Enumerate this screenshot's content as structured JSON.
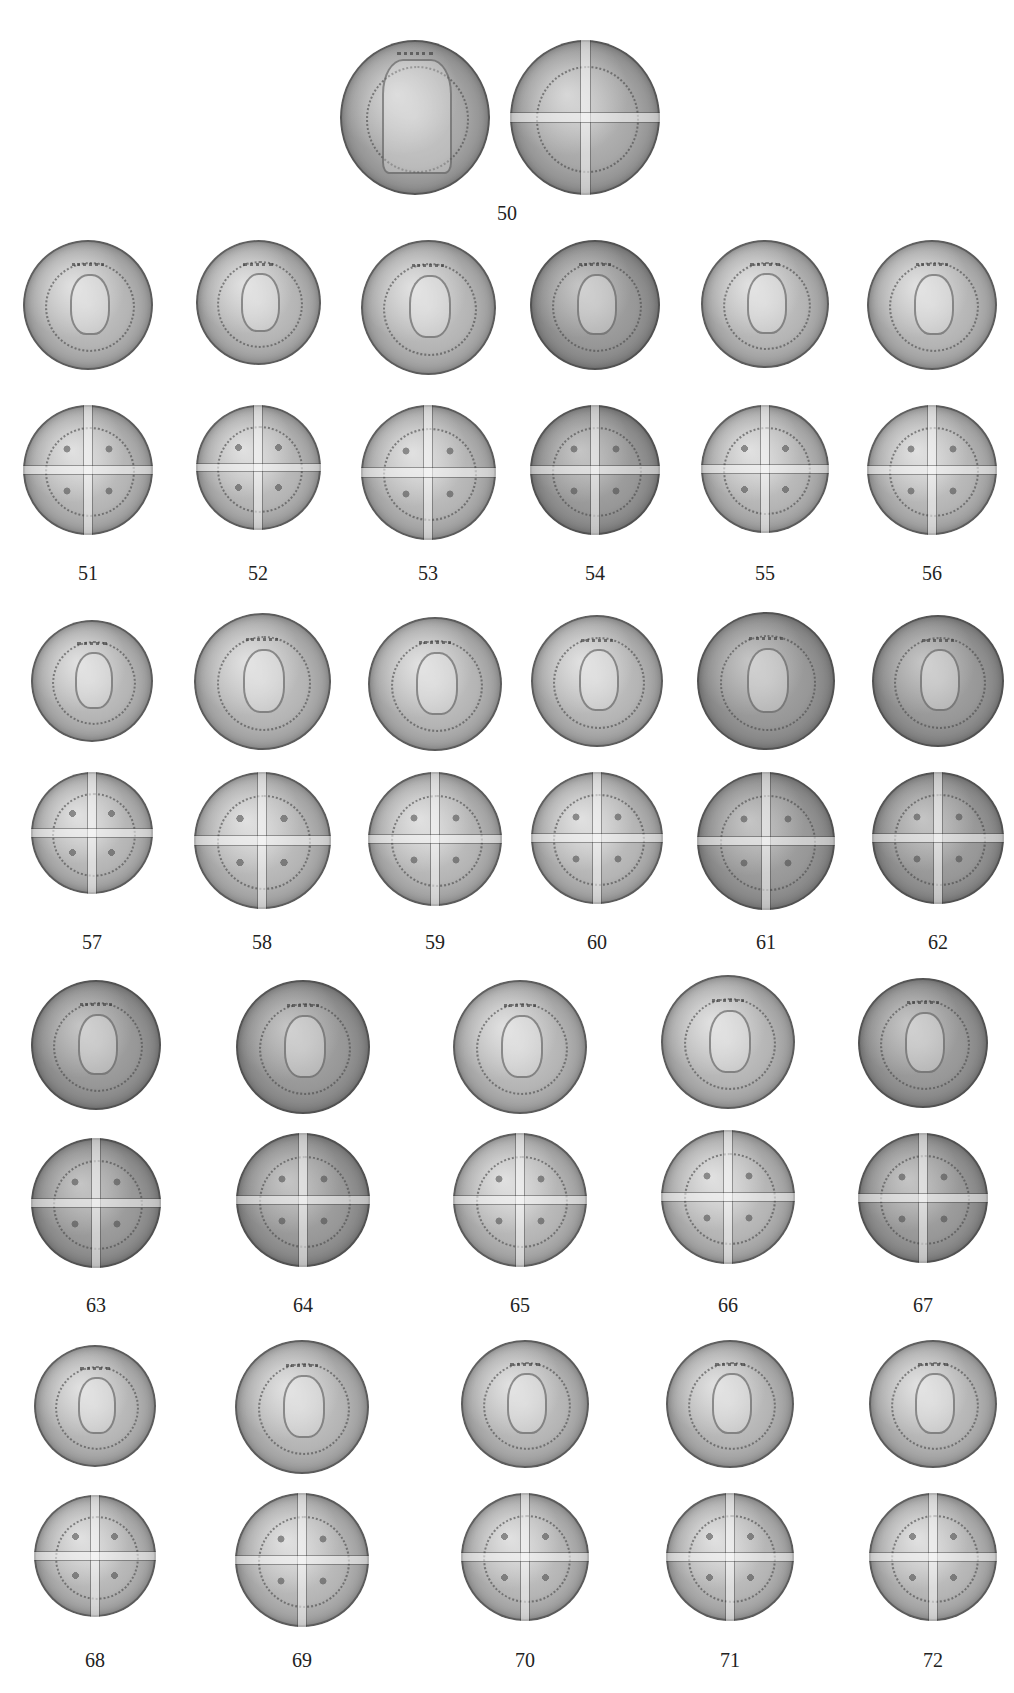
{
  "plate": {
    "background": "#ffffff",
    "entries": [
      {
        "number": "50",
        "type": "gold-noble"
      },
      {
        "number": "51"
      },
      {
        "number": "52"
      },
      {
        "number": "53"
      },
      {
        "number": "54"
      },
      {
        "number": "55"
      },
      {
        "number": "56"
      },
      {
        "number": "57"
      },
      {
        "number": "58"
      },
      {
        "number": "59"
      },
      {
        "number": "60"
      },
      {
        "number": "61"
      },
      {
        "number": "62"
      },
      {
        "number": "63"
      },
      {
        "number": "64"
      },
      {
        "number": "65"
      },
      {
        "number": "66"
      },
      {
        "number": "67"
      },
      {
        "number": "68"
      },
      {
        "number": "69"
      },
      {
        "number": "70"
      },
      {
        "number": "71"
      },
      {
        "number": "72"
      }
    ],
    "face_types": {
      "obverse": "crowned facing bust",
      "reverse": "long voided cross with pellets",
      "obverse_50": "enthroned king"
    }
  }
}
